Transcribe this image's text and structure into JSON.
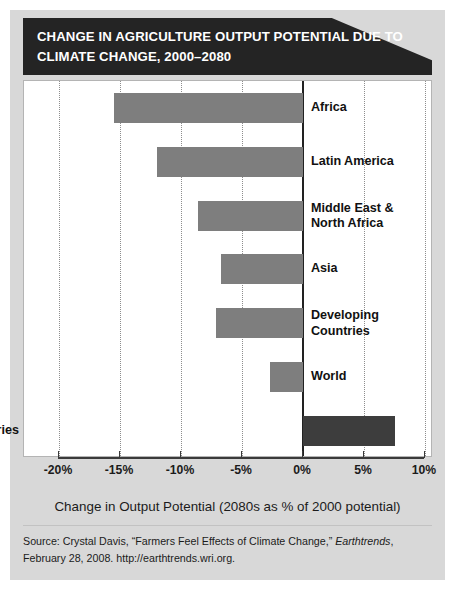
{
  "title": "CHANGE IN AGRICULTURE OUTPUT POTENTIAL DUE TO CLIMATE CHANGE, 2000–2080",
  "axis_title": "Change in Output Potential (2080s as % of 2000 potential)",
  "source": {
    "line1_pre": "Source: Crystal Davis, “Farmers Feel Effects of Climate Change,” ",
    "line1_italic": "Earthtrends",
    "line1_post": ",",
    "line2": "February 28, 2008. http://earthtrends.wri.org."
  },
  "colors": {
    "banner": "#242424",
    "bar": "#7e7e7e",
    "bar_highlight": "#3d3d3d",
    "page_background": "#d8d8d8",
    "plot_background": "#ffffff",
    "gridline": "#8d8d8d",
    "axis": "#3a3a3a"
  },
  "chart_data": {
    "type": "bar",
    "orientation": "horizontal",
    "title": "CHANGE IN AGRICULTURE OUTPUT POTENTIAL DUE TO CLIMATE CHANGE, 2000–2080",
    "xlabel": "Change in Output Potential (2080s as % of 2000 potential)",
    "ylabel": "",
    "xlim": [
      -20,
      10
    ],
    "xticks": [
      -20,
      -15,
      -10,
      -5,
      0,
      5,
      10
    ],
    "xtick_labels": [
      "-20%",
      "-15%",
      "-10%",
      "-5%",
      "0%",
      "5%",
      "10%"
    ],
    "grid": "vertical-dotted",
    "legend": "none",
    "units": "percent",
    "categories": [
      "Africa",
      "Latin America",
      "Middle East & North Africa",
      "Asia",
      "Developing Countries",
      "World",
      "Industrial Countries"
    ],
    "values": [
      -15.5,
      -12.0,
      -8.6,
      -6.7,
      -7.1,
      -2.7,
      7.5
    ],
    "bars": [
      {
        "label": "Africa",
        "label_lines": "Africa",
        "value": -15.5,
        "highlight": false,
        "label_side": "right"
      },
      {
        "label": "Latin America",
        "label_lines": "Latin America",
        "value": -12.0,
        "highlight": false,
        "label_side": "right"
      },
      {
        "label": "Middle East & North Africa",
        "label_lines": "Middle East &\nNorth Africa",
        "value": -8.6,
        "highlight": false,
        "label_side": "right"
      },
      {
        "label": "Asia",
        "label_lines": "Asia",
        "value": -6.7,
        "highlight": false,
        "label_side": "right"
      },
      {
        "label": "Developing Countries",
        "label_lines": "Developing\nCountries",
        "value": -7.1,
        "highlight": false,
        "label_side": "right"
      },
      {
        "label": "World",
        "label_lines": "World",
        "value": -2.7,
        "highlight": false,
        "label_side": "right"
      },
      {
        "label": "Industrial Countries",
        "label_lines": "Industrial Countries",
        "value": 7.5,
        "highlight": true,
        "label_side": "left"
      }
    ]
  }
}
